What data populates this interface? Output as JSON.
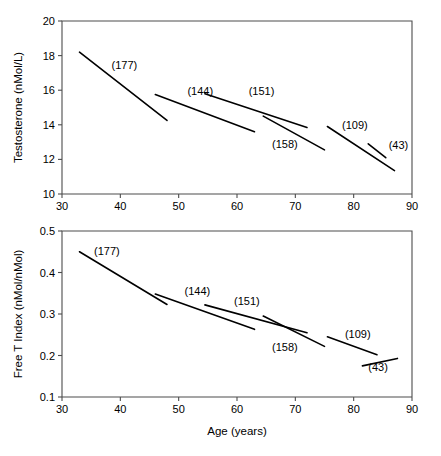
{
  "figure": {
    "xlabel": "Age (years)",
    "panels": [
      "testosterone",
      "free_t_index"
    ]
  },
  "chart_data": [
    {
      "type": "line",
      "title": "",
      "xlabel": "",
      "ylabel": "Testosterone (nMol/L)",
      "xlim": [
        30,
        90
      ],
      "ylim": [
        10,
        20
      ],
      "xticks": [
        30,
        40,
        50,
        60,
        70,
        80,
        90
      ],
      "yticks": [
        10,
        12,
        14,
        16,
        18,
        20
      ],
      "xtick_labels": [
        "30",
        "40",
        "50",
        "60",
        "70",
        "80",
        "90"
      ],
      "ytick_labels": [
        "10",
        "12",
        "14",
        "16",
        "18",
        "20"
      ],
      "grid": false,
      "legend": "inline-annotations",
      "series": [
        {
          "name": "(177)",
          "n": 177,
          "x": [
            33.0,
            48.0
          ],
          "y": [
            18.2,
            14.25
          ],
          "label_x": 38.5,
          "label_y": 17.25
        },
        {
          "name": "(144)",
          "n": 144,
          "x": [
            46.0,
            63.0
          ],
          "y": [
            15.75,
            13.6
          ],
          "label_x": 51.5,
          "label_y": 15.75
        },
        {
          "name": "(151)",
          "n": 151,
          "x": [
            54.5,
            72.0
          ],
          "y": [
            15.8,
            13.85
          ],
          "label_x": 62.0,
          "label_y": 15.75
        },
        {
          "name": "(158)",
          "n": 158,
          "x": [
            64.5,
            75.0
          ],
          "y": [
            14.5,
            12.55
          ],
          "label_x": 66.0,
          "label_y": 12.65
        },
        {
          "name": "(109)",
          "n": 109,
          "x": [
            75.5,
            87.0
          ],
          "y": [
            13.9,
            11.35
          ],
          "label_x": 78.0,
          "label_y": 13.75
        },
        {
          "name": "(43)",
          "n": 43,
          "x": [
            82.5,
            85.5
          ],
          "y": [
            12.9,
            12.1
          ],
          "label_x": 86.0,
          "label_y": 12.6
        }
      ]
    },
    {
      "type": "line",
      "title": "",
      "xlabel": "Age (years)",
      "ylabel": "Free T Index (nMol/nMol)",
      "xlim": [
        30,
        90
      ],
      "ylim": [
        0.1,
        0.5
      ],
      "xticks": [
        30,
        40,
        50,
        60,
        70,
        80,
        90
      ],
      "yticks": [
        0.1,
        0.2,
        0.3,
        0.4,
        0.5
      ],
      "xtick_labels": [
        "30",
        "40",
        "50",
        "60",
        "70",
        "80",
        "90"
      ],
      "ytick_labels": [
        "0.1",
        "0.2",
        "0.3",
        "0.4",
        "0.5"
      ],
      "grid": false,
      "legend": "inline-annotations",
      "series": [
        {
          "name": "(177)",
          "n": 177,
          "x": [
            33.0,
            48.0
          ],
          "y": [
            0.45,
            0.323
          ],
          "label_x": 35.5,
          "label_y": 0.442
        },
        {
          "name": "(144)",
          "n": 144,
          "x": [
            46.0,
            63.0
          ],
          "y": [
            0.348,
            0.263
          ],
          "label_x": 51.0,
          "label_y": 0.345
        },
        {
          "name": "(151)",
          "n": 151,
          "x": [
            54.5,
            72.0
          ],
          "y": [
            0.322,
            0.255
          ],
          "label_x": 59.5,
          "label_y": 0.322
        },
        {
          "name": "(158)",
          "n": 158,
          "x": [
            64.5,
            75.0
          ],
          "y": [
            0.295,
            0.222
          ],
          "label_x": 66.0,
          "label_y": 0.212
        },
        {
          "name": "(109)",
          "n": 109,
          "x": [
            75.5,
            84.0
          ],
          "y": [
            0.245,
            0.202
          ],
          "label_x": 78.5,
          "label_y": 0.243
        },
        {
          "name": "(43)",
          "n": 43,
          "x": [
            81.5,
            87.5
          ],
          "y": [
            0.175,
            0.193
          ],
          "label_x": 82.5,
          "label_y": 0.162
        }
      ]
    }
  ]
}
